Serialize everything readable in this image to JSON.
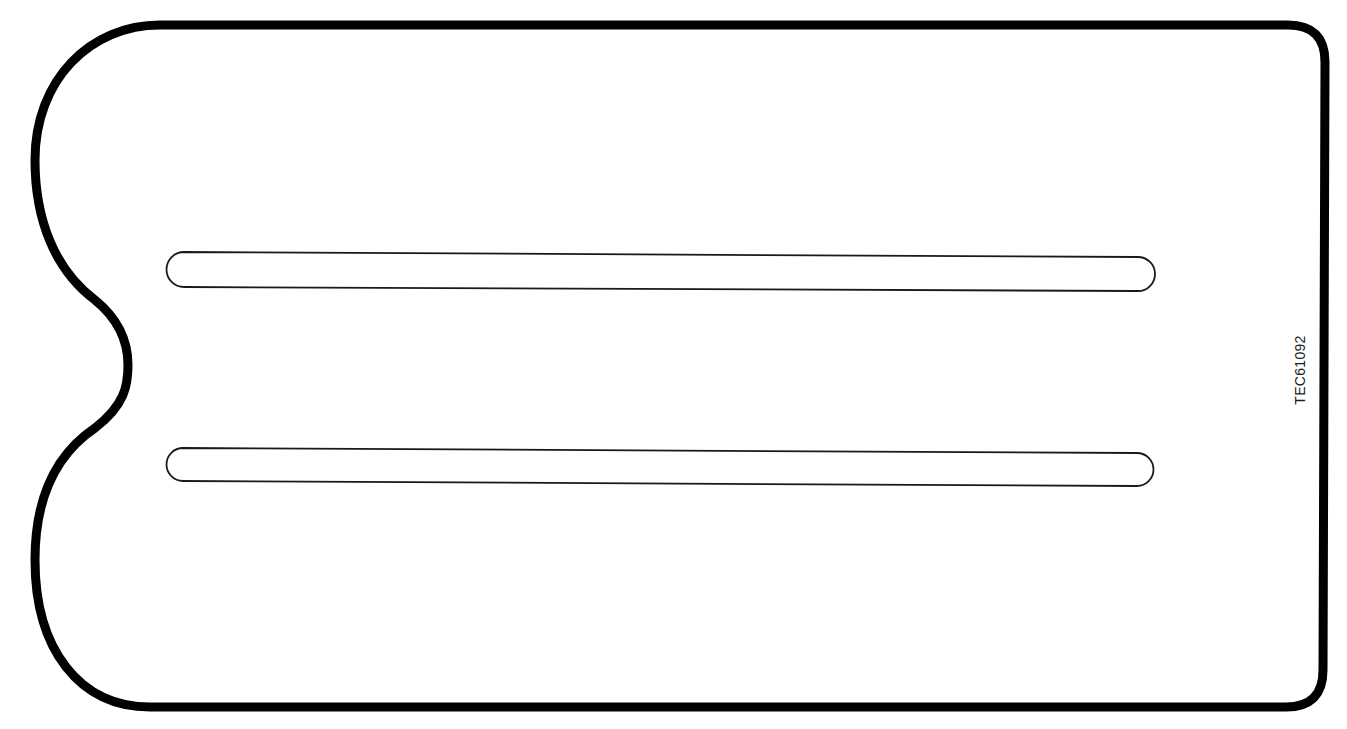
{
  "figure": {
    "reference_code": "TEC61092",
    "outline_color": "#000000",
    "slot_color": "#1a1a1a",
    "background": "#ffffff",
    "parts": [
      {
        "name": "outer-outline",
        "description": "Rounded plate outline with semicircular notch on left side"
      },
      {
        "name": "slot-upper",
        "description": "Upper elongated slot"
      },
      {
        "name": "slot-lower",
        "description": "Lower elongated slot"
      }
    ]
  }
}
